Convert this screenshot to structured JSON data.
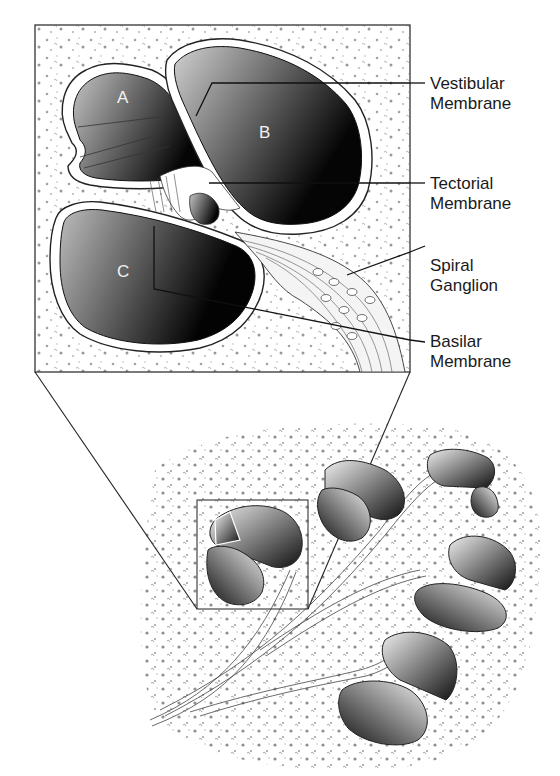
{
  "figure": {
    "chambers": [
      {
        "id": "A",
        "label": "A"
      },
      {
        "id": "B",
        "label": "B"
      },
      {
        "id": "C",
        "label": "C"
      }
    ],
    "callouts": [
      {
        "id": "vestibular",
        "line1": "Vestibular",
        "line2": "Membrane"
      },
      {
        "id": "tectorial",
        "line1": "Tectorial",
        "line2": "Membrane"
      },
      {
        "id": "spiral",
        "line1": "Spiral",
        "line2": "Ganglion"
      },
      {
        "id": "basilar",
        "line1": "Basilar",
        "line2": "Membrane"
      }
    ],
    "colors": {
      "ink": "#1a1a1a",
      "chamber_light": "#bdbdbd",
      "chamber_dark": "#050505",
      "background": "#ffffff"
    }
  }
}
